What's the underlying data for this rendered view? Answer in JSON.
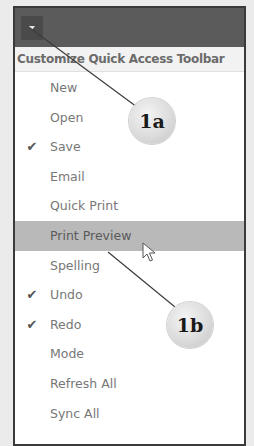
{
  "toolbar": {
    "dropdown_icon": "chevron-down-icon"
  },
  "menu": {
    "title": "Customize Quick Access Toolbar",
    "items": [
      {
        "label": "New",
        "checked": false
      },
      {
        "label": "Open",
        "checked": false
      },
      {
        "label": "Save",
        "checked": true
      },
      {
        "label": "Email",
        "checked": false
      },
      {
        "label": "Quick Print",
        "checked": false
      },
      {
        "label": "Print Preview",
        "checked": false,
        "highlighted": true
      },
      {
        "label": "Spelling",
        "checked": false
      },
      {
        "label": "Undo",
        "checked": true
      },
      {
        "label": "Redo",
        "checked": true
      },
      {
        "label": "Mode",
        "checked": false
      },
      {
        "label": "Refresh All",
        "checked": false
      },
      {
        "label": "Sync All",
        "checked": false
      }
    ],
    "check_glyph": "✔"
  },
  "callouts": {
    "a": "1a",
    "b": "1b"
  },
  "colors": {
    "toolbar_bg": "#5b5b5b",
    "highlight_bg": "#b9b9b9",
    "header_text": "#6b6b6b"
  }
}
